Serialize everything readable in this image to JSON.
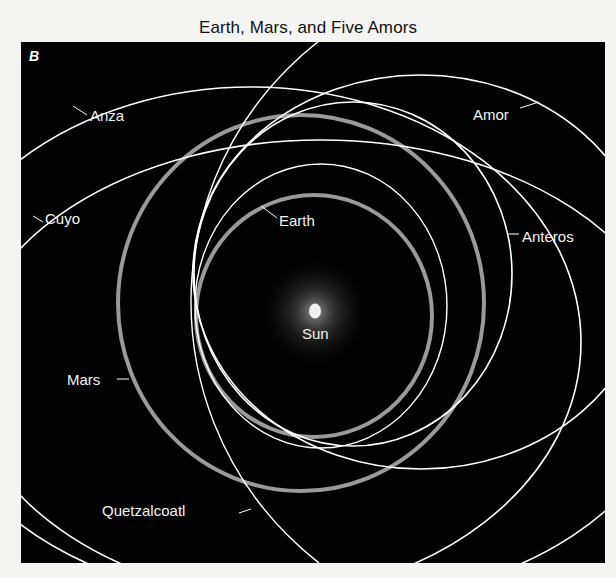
{
  "title": "Earth, Mars, and Five Amors",
  "panel_letter": "B",
  "center_body": {
    "name": "Sun",
    "label": "Sun"
  },
  "orbits": [
    {
      "name": "Earth",
      "label": "Earth",
      "kind": "planet",
      "color": "#9a9a9a"
    },
    {
      "name": "Mars",
      "label": "Mars",
      "kind": "planet",
      "color": "#9a9a9a"
    },
    {
      "name": "Amor",
      "label": "Amor",
      "kind": "asteroid",
      "color": "#ffffff"
    },
    {
      "name": "Anteros",
      "label": "Anteros",
      "kind": "asteroid",
      "color": "#ffffff"
    },
    {
      "name": "Anza",
      "label": "Anza",
      "kind": "asteroid",
      "color": "#ffffff"
    },
    {
      "name": "Cuyo",
      "label": "Cuyo",
      "kind": "asteroid",
      "color": "#ffffff"
    },
    {
      "name": "Quetzalcoatl",
      "label": "Quetzalcoatl",
      "kind": "asteroid",
      "color": "#ffffff"
    }
  ],
  "colors": {
    "background": "#020202",
    "planet_orbit": "#9a9a9a",
    "asteroid_orbit": "#ffffff",
    "sun": "#f0f0f0"
  }
}
